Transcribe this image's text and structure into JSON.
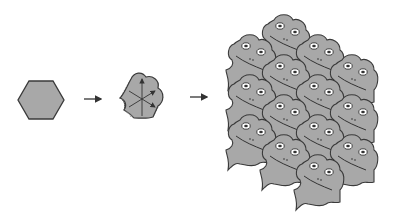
{
  "diagram": {
    "stages": [
      {
        "name": "hexagon",
        "label": ""
      },
      {
        "name": "deformed-tile",
        "label": ""
      },
      {
        "name": "tessellation",
        "label": ""
      }
    ],
    "arrows": [
      {
        "from": "hexagon",
        "to": "deformed-tile"
      },
      {
        "from": "deformed-tile",
        "to": "tessellation"
      }
    ],
    "tessellation": {
      "rows": 4,
      "cols": 4,
      "tile_count": 16
    },
    "colors": {
      "tile_fill": "#a8a8a8",
      "outline": "#3a3a3a",
      "eye_white": "#ffffff",
      "dashed": "#888888",
      "background": "#ffffff"
    }
  }
}
